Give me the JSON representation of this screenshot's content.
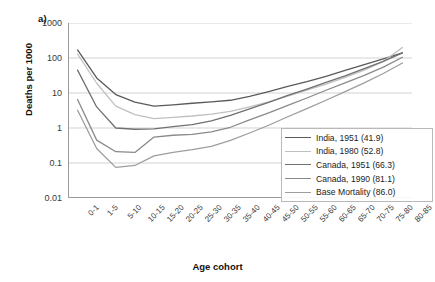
{
  "panel": {
    "label": "a)"
  },
  "chart_data": {
    "type": "line",
    "title": "",
    "xlabel": "Age cohort",
    "ylabel": "Deaths per 1000",
    "yscale": "log",
    "ylim": [
      0.01,
      1000
    ],
    "yticks": [
      1000,
      100,
      10,
      1,
      0.1,
      0.01
    ],
    "ytick_labels": [
      "1000",
      "100",
      "10",
      "1",
      "0.1",
      "0.01"
    ],
    "grid": "horizontal",
    "legend_position": "inside-lower-right",
    "categories": [
      "0-1",
      "1-5",
      "5-10",
      "10-15",
      "15-20",
      "20-25",
      "25-30",
      "30-35",
      "35-40",
      "40-45",
      "45-50",
      "50-55",
      "55-60",
      "60-65",
      "65-70",
      "70-75",
      "75-80",
      "80-85"
    ],
    "series": [
      {
        "name": "India, 1951 (41.9)",
        "label": "India, 1951 (41.9)",
        "color": "#5a5a5a",
        "values": [
          170,
          27,
          9.0,
          5.5,
          4.2,
          4.6,
          5.1,
          5.6,
          6.2,
          8.0,
          11.0,
          15.5,
          21.0,
          30.0,
          44.0,
          65.0,
          95.0,
          140.0
        ]
      },
      {
        "name": "India, 1980 (52.8)",
        "label": "India, 1980 (52.8)",
        "color": "#c0c0c0",
        "values": [
          130,
          19,
          4.2,
          2.4,
          1.85,
          2.0,
          2.2,
          2.5,
          3.0,
          4.0,
          5.6,
          8.2,
          12.0,
          18.0,
          28.0,
          45.0,
          80.0,
          200.0
        ]
      },
      {
        "name": "Canada, 1951 (66.3)",
        "label": "Canada, 1951 (66.3)",
        "color": "#707070",
        "values": [
          45,
          4.0,
          1.0,
          0.92,
          0.95,
          1.1,
          1.25,
          1.6,
          2.3,
          3.5,
          5.4,
          8.5,
          13.0,
          20.0,
          31.0,
          50.0,
          80.0,
          140.0
        ]
      },
      {
        "name": "Canada, 1990 (81.1)",
        "label": "Canada, 1990 (81.1)",
        "color": "#8a8a8a",
        "values": [
          6.5,
          0.45,
          0.21,
          0.2,
          0.55,
          0.62,
          0.66,
          0.78,
          1.05,
          1.7,
          2.7,
          4.4,
          7.2,
          12.0,
          19.5,
          32.0,
          55.0,
          105.0
        ]
      },
      {
        "name": "Base Mortality (86.0)",
        "label": "Base Mortality (86.0)",
        "color": "#9e9e9e",
        "values": [
          3.2,
          0.26,
          0.075,
          0.085,
          0.16,
          0.2,
          0.24,
          0.3,
          0.44,
          0.72,
          1.2,
          2.1,
          3.6,
          6.2,
          11.0,
          19.5,
          36.0,
          72.0
        ]
      }
    ]
  }
}
